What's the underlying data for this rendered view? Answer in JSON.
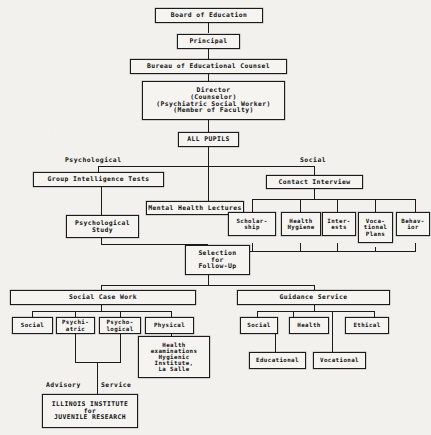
{
  "diagram": {
    "nodes": {
      "board_of_education": "Board of Education",
      "principal": "Principal",
      "bureau": "Bureau of Educational Counsel",
      "director": "Director\n(Counselor)\n(Psychiatric Social Worker)\n(Member of Faculty)",
      "all_pupils": "ALL PUPILS",
      "group_intelligence_tests": "Group Intelligence Tests",
      "contact_interview": "Contact Interview",
      "mental_health_lectures": "Mental Health Lectures",
      "psychological_study": "Psychological\nStudy",
      "scholarship": "Scholar-\nship",
      "health_hygiene": "Health\nHygiene",
      "interests": "Inter-\nests",
      "vocational_plans": "Voca-\ntional\nPlans",
      "behavior": "Behav-\nior",
      "selection_follow_up": "Selection\nfor\nFollow-Up",
      "social_case_work": "Social Case Work",
      "scw_social": "Social",
      "scw_psychiatric": "Psychi-\natric",
      "scw_psychological": "Psycho-\nlogical",
      "scw_physical": "Physical",
      "health_examinations": "Health\nexaminations\nHygienic\nInstitute,\nLa Salle",
      "guidance_service": "Guidance Service",
      "gs_social": "Social",
      "gs_health": "Health",
      "gs_ethical": "Ethical",
      "gs_educational": "Educational",
      "gs_vocational": "Vocational",
      "illinois_institute": "ILLINOIS INSTITUTE\nfor\nJUVENILE RESEARCH"
    },
    "labels": {
      "psychological": "Psychological",
      "social": "Social",
      "advisory": "Advisory",
      "service": "Service"
    },
    "colors": {
      "ink": "#1b1b1b",
      "paper": "#f3f1ee",
      "box_fill": "#f6f4f1"
    }
  }
}
